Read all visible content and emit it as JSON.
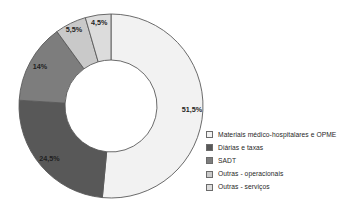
{
  "chart_data": {
    "type": "pie",
    "variant": "donut",
    "title": "",
    "subtitle": "",
    "xlabel": "",
    "ylabel": "",
    "grid": false,
    "legend_position": "right",
    "start_angle_deg": 0,
    "direction": "clockwise",
    "inner_radius_ratio": 0.5,
    "categories": [
      "Materiais médico-hospitalares e OPME",
      "Diárias e taxas",
      "SADT",
      "Outras - operacionais",
      "Outras - serviços"
    ],
    "values": [
      51.5,
      24.5,
      14,
      5.5,
      4.5
    ],
    "data_labels": [
      "51,5%",
      "24,5%",
      "14%",
      "5,5%",
      "4,5%"
    ],
    "colors": [
      "#f2f2f2",
      "#585858",
      "#7d7d7d",
      "#c9c9c9",
      "#dcdcdc"
    ],
    "slice_border_color": "#5a5a5a",
    "units": "percent"
  },
  "legend": {
    "items": [
      {
        "label": "Materiais médico-hospitalares e OPME",
        "color": "#f2f2f2"
      },
      {
        "label": "Diárias e taxas",
        "color": "#585858"
      },
      {
        "label": "SADT",
        "color": "#7d7d7d"
      },
      {
        "label": "Outras - operacionais",
        "color": "#c9c9c9"
      },
      {
        "label": "Outras - serviços",
        "color": "#dcdcdc"
      }
    ]
  }
}
